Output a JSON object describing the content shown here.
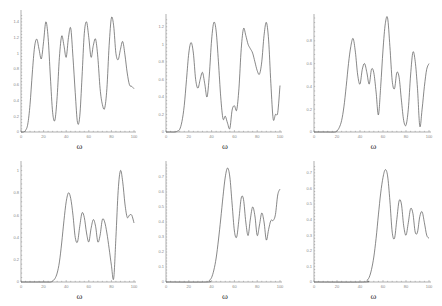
{
  "chart_data": [
    {
      "type": "line",
      "panel": "top-left",
      "xlabel": "ω",
      "ylabel": "",
      "xlim": [
        0,
        100
      ],
      "ylim": [
        0,
        1.5
      ],
      "xticks": [
        0,
        20,
        40,
        60,
        80,
        100
      ],
      "yticks": [
        0,
        0.2,
        0.4,
        0.6,
        0.8,
        1,
        1.2,
        1.4
      ],
      "x": [
        0,
        2,
        4,
        6,
        8,
        10,
        12,
        14,
        16,
        18,
        20,
        22,
        24,
        26,
        28,
        30,
        32,
        34,
        36,
        38,
        40,
        42,
        44,
        46,
        48,
        50,
        52,
        54,
        56,
        58,
        60,
        62,
        64,
        66,
        68,
        70,
        72,
        74,
        76,
        78,
        80,
        82,
        84,
        86,
        88,
        90,
        92,
        94,
        96,
        98,
        100
      ],
      "values": [
        0,
        0,
        0.02,
        0.1,
        0.35,
        0.75,
        1.08,
        1.18,
        1.05,
        0.93,
        1.15,
        1.4,
        1.2,
        0.7,
        0.25,
        0.15,
        0.45,
        0.95,
        1.22,
        1.1,
        0.95,
        1.2,
        1.32,
        0.95,
        0.5,
        0.12,
        0.2,
        0.7,
        1.25,
        1.4,
        1.2,
        0.95,
        1.1,
        1.18,
        0.95,
        0.55,
        0.35,
        0.3,
        0.55,
        1.1,
        1.45,
        1.35,
        1.0,
        0.92,
        1.05,
        1.15,
        0.98,
        0.75,
        0.6,
        0.58,
        0.55
      ]
    },
    {
      "type": "line",
      "panel": "top-middle",
      "xlabel": "ω",
      "ylabel": "",
      "xlim": [
        0,
        100
      ],
      "ylim": [
        0,
        1.3
      ],
      "xticks": [
        0,
        20,
        40,
        60,
        80,
        100
      ],
      "yticks": [
        0,
        0.2,
        0.4,
        0.6,
        0.8,
        1,
        1.2
      ],
      "x": [
        0,
        4,
        8,
        10,
        12,
        14,
        16,
        18,
        20,
        22,
        24,
        26,
        28,
        30,
        32,
        34,
        36,
        38,
        40,
        42,
        44,
        46,
        48,
        50,
        52,
        54,
        56,
        58,
        60,
        62,
        64,
        66,
        68,
        70,
        72,
        74,
        76,
        78,
        80,
        82,
        84,
        86,
        88,
        90,
        92,
        94,
        96,
        98,
        100
      ],
      "values": [
        0,
        0,
        0,
        0.01,
        0.03,
        0.12,
        0.3,
        0.6,
        0.9,
        1.02,
        0.9,
        0.6,
        0.5,
        0.6,
        0.68,
        0.55,
        0.4,
        0.65,
        1.05,
        1.25,
        1.15,
        0.8,
        0.4,
        0.15,
        0.18,
        0.1,
        0.04,
        0.25,
        0.3,
        0.25,
        0.5,
        0.95,
        1.18,
        1.1,
        1.0,
        0.95,
        0.9,
        0.8,
        0.7,
        0.66,
        0.8,
        1.1,
        1.25,
        1.05,
        0.55,
        0.15,
        0.2,
        0.22,
        0.53
      ]
    },
    {
      "type": "line",
      "panel": "top-right",
      "xlabel": "ω",
      "ylabel": "",
      "xlim": [
        0,
        100
      ],
      "ylim": [
        0,
        1.0
      ],
      "xticks": [
        0,
        20,
        40,
        60,
        80,
        100
      ],
      "yticks": [
        0,
        0.2,
        0.4,
        0.6,
        0.8
      ],
      "x": [
        0,
        10,
        18,
        20,
        22,
        24,
        26,
        28,
        30,
        32,
        34,
        36,
        38,
        40,
        42,
        44,
        46,
        48,
        50,
        52,
        54,
        56,
        58,
        60,
        62,
        64,
        66,
        68,
        70,
        72,
        74,
        76,
        78,
        80,
        82,
        84,
        86,
        88,
        90,
        92,
        94,
        96,
        98,
        100
      ],
      "values": [
        0,
        0,
        0,
        0.01,
        0.04,
        0.1,
        0.22,
        0.4,
        0.6,
        0.75,
        0.82,
        0.7,
        0.5,
        0.42,
        0.55,
        0.6,
        0.52,
        0.42,
        0.55,
        0.52,
        0.35,
        0.15,
        0.4,
        0.72,
        0.95,
        1.0,
        0.75,
        0.45,
        0.38,
        0.52,
        0.48,
        0.28,
        0.1,
        0.06,
        0.2,
        0.5,
        0.7,
        0.62,
        0.38,
        0.05,
        0.2,
        0.4,
        0.55,
        0.6
      ]
    },
    {
      "type": "line",
      "panel": "bottom-left",
      "xlabel": "ω",
      "ylabel": "",
      "xlim": [
        0,
        100
      ],
      "ylim": [
        0,
        1.05
      ],
      "xticks": [
        0,
        20,
        40,
        60,
        80,
        100
      ],
      "yticks": [
        0,
        0.2,
        0.4,
        0.6,
        0.8,
        1
      ],
      "x": [
        0,
        20,
        26,
        28,
        30,
        32,
        34,
        36,
        38,
        40,
        42,
        44,
        46,
        48,
        50,
        52,
        54,
        56,
        58,
        60,
        62,
        64,
        66,
        68,
        70,
        72,
        74,
        76,
        78,
        80,
        82,
        84,
        86,
        88,
        90,
        92,
        94,
        96,
        98,
        100
      ],
      "values": [
        0,
        0,
        0,
        0.01,
        0.03,
        0.08,
        0.18,
        0.35,
        0.55,
        0.72,
        0.8,
        0.75,
        0.6,
        0.4,
        0.36,
        0.5,
        0.62,
        0.58,
        0.44,
        0.36,
        0.48,
        0.56,
        0.5,
        0.36,
        0.42,
        0.56,
        0.54,
        0.44,
        0.3,
        0.15,
        0.03,
        0.4,
        0.82,
        1.0,
        0.9,
        0.7,
        0.58,
        0.6,
        0.6,
        0.53
      ]
    },
    {
      "type": "line",
      "panel": "bottom-middle",
      "xlabel": "ω",
      "ylabel": "",
      "xlim": [
        0,
        100
      ],
      "ylim": [
        0,
        0.78
      ],
      "xticks": [
        0,
        20,
        40,
        60,
        80,
        100
      ],
      "yticks": [
        0,
        0.1,
        0.2,
        0.3,
        0.4,
        0.5,
        0.6,
        0.7
      ],
      "x": [
        0,
        36,
        38,
        40,
        42,
        44,
        46,
        48,
        50,
        52,
        54,
        56,
        58,
        60,
        62,
        64,
        66,
        68,
        70,
        72,
        74,
        76,
        78,
        80,
        82,
        84,
        86,
        88,
        90,
        92,
        94,
        96,
        98,
        100
      ],
      "values": [
        0,
        0,
        0.01,
        0.03,
        0.08,
        0.16,
        0.28,
        0.42,
        0.57,
        0.7,
        0.76,
        0.7,
        0.52,
        0.34,
        0.3,
        0.42,
        0.56,
        0.55,
        0.4,
        0.31,
        0.42,
        0.5,
        0.44,
        0.31,
        0.38,
        0.46,
        0.4,
        0.28,
        0.35,
        0.41,
        0.41,
        0.45,
        0.58,
        0.62
      ]
    },
    {
      "type": "line",
      "panel": "bottom-right",
      "xlabel": "ω",
      "ylabel": "",
      "xlim": [
        0,
        100
      ],
      "ylim": [
        0,
        0.75
      ],
      "xticks": [
        0,
        20,
        40,
        60,
        80,
        100
      ],
      "yticks": [
        0,
        0.1,
        0.2,
        0.3,
        0.4,
        0.5,
        0.6,
        0.7
      ],
      "x": [
        0,
        44,
        46,
        48,
        50,
        52,
        54,
        56,
        58,
        60,
        62,
        64,
        66,
        68,
        70,
        72,
        74,
        76,
        78,
        80,
        82,
        84,
        86,
        88,
        90,
        92,
        94,
        96,
        98,
        100
      ],
      "values": [
        0,
        0,
        0.01,
        0.03,
        0.08,
        0.16,
        0.28,
        0.43,
        0.57,
        0.67,
        0.72,
        0.68,
        0.52,
        0.32,
        0.28,
        0.4,
        0.52,
        0.5,
        0.36,
        0.3,
        0.38,
        0.47,
        0.44,
        0.32,
        0.32,
        0.42,
        0.45,
        0.38,
        0.3,
        0.28
      ]
    }
  ],
  "panels": [
    {
      "xlabel": "ω"
    },
    {
      "xlabel": "ω"
    },
    {
      "xlabel": "ω"
    },
    {
      "xlabel": "ω"
    },
    {
      "xlabel": "ω"
    },
    {
      "xlabel": "ω"
    }
  ]
}
